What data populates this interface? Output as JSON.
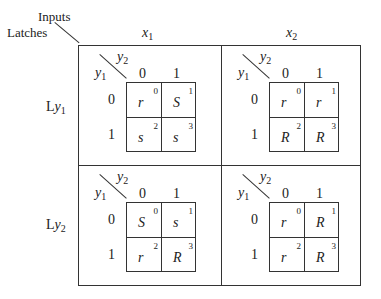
{
  "header": {
    "inputs_label": "Inputs",
    "latches_label": "Latches",
    "columns": [
      {
        "var": "x",
        "sub": "1"
      },
      {
        "var": "x",
        "sub": "2"
      }
    ],
    "rows": [
      {
        "prefix": "L",
        "var": "y",
        "sub": "1"
      },
      {
        "prefix": "L",
        "var": "y",
        "sub": "2"
      }
    ]
  },
  "kmap_axes": {
    "col_var": "y",
    "col_sub": "2",
    "row_var": "y",
    "row_sub": "1",
    "col_values": [
      "0",
      "1"
    ],
    "row_values": [
      "0",
      "1"
    ]
  },
  "maps": [
    {
      "id": "Ly1_x1",
      "cells": [
        {
          "val": "r",
          "idx": "0"
        },
        {
          "val": "S",
          "idx": "1"
        },
        {
          "val": "s",
          "idx": "2"
        },
        {
          "val": "s",
          "idx": "3"
        }
      ]
    },
    {
      "id": "Ly1_x2",
      "cells": [
        {
          "val": "r",
          "idx": "0"
        },
        {
          "val": "r",
          "idx": "1"
        },
        {
          "val": "R",
          "idx": "2"
        },
        {
          "val": "R",
          "idx": "3"
        }
      ]
    },
    {
      "id": "Ly2_x1",
      "cells": [
        {
          "val": "S",
          "idx": "0"
        },
        {
          "val": "s",
          "idx": "1"
        },
        {
          "val": "r",
          "idx": "2"
        },
        {
          "val": "R",
          "idx": "3"
        }
      ]
    },
    {
      "id": "Ly2_x2",
      "cells": [
        {
          "val": "r",
          "idx": "0"
        },
        {
          "val": "R",
          "idx": "1"
        },
        {
          "val": "r",
          "idx": "2"
        },
        {
          "val": "R",
          "idx": "3"
        }
      ]
    }
  ]
}
